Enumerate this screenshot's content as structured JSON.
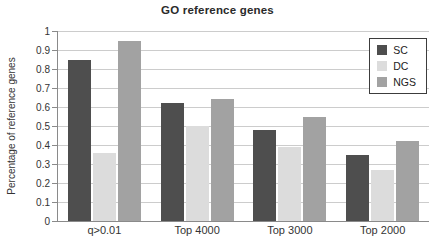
{
  "chart_data": {
    "type": "bar",
    "title": "GO reference genes",
    "xlabel": "",
    "ylabel": "Percentage of reference genes",
    "categories": [
      "q>0.01",
      "Top 4000",
      "Top 3000",
      "Top 2000"
    ],
    "series": [
      {
        "name": "SC",
        "color": "#4e4e4e",
        "values": [
          0.85,
          0.62,
          0.48,
          0.35
        ]
      },
      {
        "name": "DC",
        "color": "#dcdcdc",
        "values": [
          0.36,
          0.5,
          0.39,
          0.27
        ]
      },
      {
        "name": "NGS",
        "color": "#a2a2a2",
        "values": [
          0.95,
          0.64,
          0.55,
          0.42
        ]
      }
    ],
    "ylim": [
      0,
      1
    ],
    "ytick_labels": [
      "0",
      "0.1",
      "0.2",
      "0.3",
      "0.4",
      "0.5",
      "0.6",
      "0.7",
      "0.8",
      "0.9",
      "1"
    ],
    "grid": true,
    "legend_position": "top-right"
  },
  "colors": {
    "grid": "#cccccc",
    "axis": "#8a8a8a",
    "text": "#333333",
    "background": "#ffffff"
  }
}
